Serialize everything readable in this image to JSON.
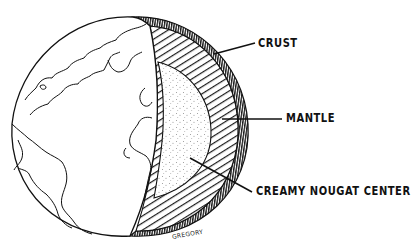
{
  "diagram": {
    "labels": [
      {
        "id": "crust",
        "text": "CRUST"
      },
      {
        "id": "mantle",
        "text": "MANTLE"
      },
      {
        "id": "center",
        "text": "CREAMY NOUGAT CENTER"
      }
    ],
    "signature": "GREGORY"
  }
}
